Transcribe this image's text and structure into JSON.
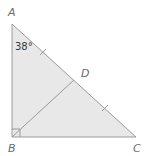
{
  "figure": {
    "type": "right-triangle",
    "colors": {
      "fill": "#e8e8e8",
      "stroke": "#9a9a9a",
      "label": "#6a6a6a",
      "angle_text": "#3a3a3a"
    },
    "vertices": [
      {
        "id": "A",
        "label": "A",
        "x": 12,
        "y": 24
      },
      {
        "id": "B",
        "label": "B",
        "x": 12,
        "y": 137
      },
      {
        "id": "C",
        "label": "C",
        "x": 136,
        "y": 137
      },
      {
        "id": "D",
        "label": "D",
        "x": 74,
        "y": 80
      }
    ],
    "segments": [
      "AB",
      "BC",
      "CA",
      "BD"
    ],
    "right_angle_at": "B",
    "congruence_ticks": [
      "AD",
      "DC"
    ],
    "angles": [
      {
        "at": "A",
        "label": "38°"
      }
    ]
  },
  "labels": {
    "A": "A",
    "B": "B",
    "C": "C",
    "D": "D",
    "angle_A": "38°"
  }
}
